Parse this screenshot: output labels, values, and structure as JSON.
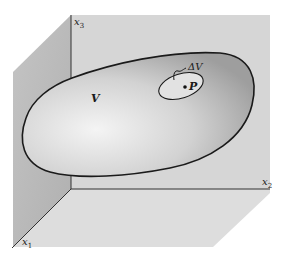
{
  "figure": {
    "axes": {
      "x1": {
        "label": "x",
        "subscript": "1"
      },
      "x2": {
        "label": "x",
        "subscript": "2"
      },
      "x3": {
        "label": "x",
        "subscript": "3"
      }
    },
    "region_label": "V",
    "subregion_label": "ΔV",
    "point_label": "P",
    "colors": {
      "back_wall": "#d6d6d6",
      "left_wall": "#b9b9b9",
      "floor": "#dddddd",
      "region_fill_light": "#f2f2f2",
      "region_fill_dark": "#a8a8a8",
      "outline": "#1a1a1a"
    }
  }
}
